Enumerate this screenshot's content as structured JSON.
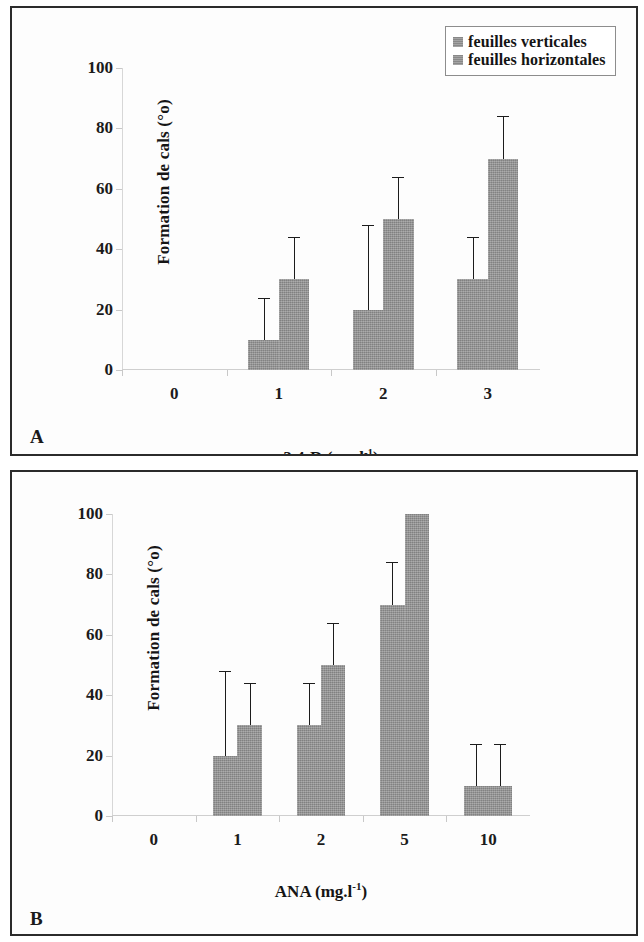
{
  "figure": {
    "panel_a_letter": "A",
    "panel_b_letter": "B"
  },
  "legend": {
    "series": [
      {
        "label": "feuilles verticales",
        "color": "#949494"
      },
      {
        "label": "feuilles horizontales",
        "color": "#949494"
      }
    ]
  },
  "axes": {
    "ylabel": "Formation de cals (°o)",
    "yticks": [
      "0",
      "20",
      "40",
      "60",
      "80",
      "100"
    ],
    "panel_a_xlabel_main": "2,4-D (mg.l",
    "panel_a_xlabel_sup": "-1",
    "panel_a_xlabel_close": ")",
    "panel_b_xlabel_main": "ANA (mg.l",
    "panel_b_xlabel_sup": "-1",
    "panel_b_xlabel_close": ")",
    "panel_a_xticks": [
      "0",
      "1",
      "2",
      "3"
    ],
    "panel_b_xticks": [
      "0",
      "1",
      "2",
      "5",
      "10"
    ]
  },
  "chart_data": [
    {
      "type": "bar",
      "panel": "A",
      "title": "",
      "xlabel": "2,4-D (mg.l-1)",
      "ylabel": "Formation de cals (%)",
      "categories": [
        "0",
        "1",
        "2",
        "3"
      ],
      "ylim": [
        0,
        100
      ],
      "yticks": [
        0,
        20,
        40,
        60,
        80,
        100
      ],
      "grid": false,
      "legend_position": "top-right",
      "series": [
        {
          "name": "feuilles verticales",
          "color": "#949494",
          "values": [
            0,
            10,
            20,
            30
          ],
          "errors": [
            0,
            14,
            28,
            14
          ]
        },
        {
          "name": "feuilles horizontales",
          "color": "#949494",
          "values": [
            0,
            30,
            50,
            70
          ],
          "errors": [
            0,
            14,
            14,
            14
          ]
        }
      ]
    },
    {
      "type": "bar",
      "panel": "B",
      "title": "",
      "xlabel": "ANA (mg.l-1)",
      "ylabel": "Formation de cals (%)",
      "categories": [
        "0",
        "1",
        "2",
        "5",
        "10"
      ],
      "ylim": [
        0,
        100
      ],
      "yticks": [
        0,
        20,
        40,
        60,
        80,
        100
      ],
      "grid": false,
      "legend_position": "top-right",
      "series": [
        {
          "name": "feuilles verticales",
          "color": "#949494",
          "values": [
            0,
            20,
            30,
            70,
            10
          ],
          "errors": [
            0,
            28,
            14,
            14,
            14
          ]
        },
        {
          "name": "feuilles horizontales",
          "color": "#949494",
          "values": [
            0,
            30,
            50,
            100,
            10
          ],
          "errors": [
            0,
            14,
            14,
            0,
            14
          ]
        }
      ]
    }
  ]
}
